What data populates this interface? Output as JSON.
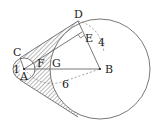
{
  "diagram": {
    "labels": {
      "C": "C",
      "D": "D",
      "E": "E",
      "F": "F",
      "G": "G",
      "A": "A",
      "B": "B",
      "r_small": "1",
      "r_big_DB": "4",
      "AB": "6"
    },
    "colors": {
      "stroke": "#555555",
      "hatch": "#666666",
      "text": "#222222"
    }
  }
}
